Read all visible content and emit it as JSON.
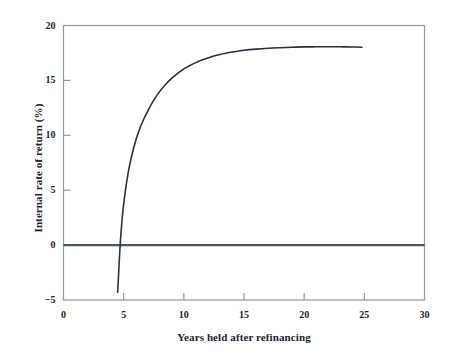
{
  "chart_data": {
    "type": "line",
    "title": "",
    "xlabel": "Years held after refinancing",
    "ylabel": "Internal rate of return (%)",
    "xlim": [
      0,
      30
    ],
    "ylim": [
      -5,
      20
    ],
    "xticks": [
      "0",
      "5",
      "10",
      "15",
      "20",
      "25",
      "30"
    ],
    "yticks": [
      "20",
      "15",
      "10",
      "5",
      "0",
      "-5"
    ],
    "grid": false,
    "legend": null,
    "reference_lines": [
      {
        "name": "zero-line",
        "axis": "y",
        "value": 0,
        "color": "#4a5668",
        "width": 2.2
      }
    ],
    "series": [
      {
        "name": "Internal rate of return",
        "color": "#2a3040",
        "x": [
          4.5,
          4.55,
          4.6,
          4.65,
          4.72,
          4.8,
          4.9,
          5.0,
          5.15,
          5.3,
          5.5,
          5.75,
          6.0,
          6.3,
          6.6,
          7.0,
          7.5,
          8.0,
          8.5,
          9.0,
          9.5,
          10.0,
          10.5,
          11.0,
          11.5,
          12.0,
          12.5,
          13.0,
          13.5,
          14.0,
          15.0,
          16.0,
          17.0,
          18.0,
          19.0,
          20.0,
          21.0,
          22.0,
          23.0,
          24.0,
          24.8
        ],
        "y": [
          -4.3,
          -3.3,
          -2.2,
          -1.1,
          0.2,
          1.4,
          2.7,
          3.7,
          5.0,
          6.1,
          7.3,
          8.5,
          9.5,
          10.5,
          11.3,
          12.2,
          13.2,
          14.0,
          14.65,
          15.2,
          15.65,
          16.05,
          16.35,
          16.62,
          16.85,
          17.05,
          17.22,
          17.36,
          17.48,
          17.58,
          17.74,
          17.85,
          17.93,
          17.98,
          18.02,
          18.05,
          18.06,
          18.07,
          18.06,
          18.04,
          18.02
        ]
      }
    ],
    "notes": {
      "curve_start": {
        "x": 4.5,
        "y": -4.3
      },
      "zero_crossing": {
        "x": 4.68,
        "y": 0
      },
      "asymptote": 18.05,
      "curve_end": {
        "x": 24.8,
        "y": 18.0
      }
    }
  },
  "style": {
    "background": "#ffffff",
    "frame_color": "#8f99a8",
    "curve_color": "#2a3040",
    "zero_line_color": "#4a5668",
    "text_color": "#1b2433"
  }
}
